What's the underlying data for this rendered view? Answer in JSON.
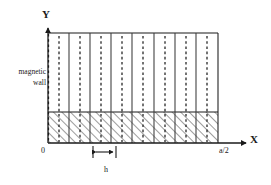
{
  "figure": {
    "axes": {
      "y_label": "Y",
      "x_label": "X",
      "origin_label": "0",
      "x_end_label": "a/2"
    },
    "annotations": {
      "magnetic_wall_line1": "magnetic",
      "magnetic_wall_line2": "wall",
      "period_label": "h"
    },
    "colors": {
      "stroke": "#1a1a1a",
      "hatch": "#555555",
      "dash": "#222222",
      "background": "#ffffff"
    },
    "geometry": {
      "x_origin": 48,
      "x_end": 218,
      "y_top": 33,
      "y_hatch_top": 112,
      "y_baseline": 143,
      "cell_count": 8,
      "dashed_line_count": 9,
      "h_marker_left": 93,
      "h_marker_right": 116,
      "h_marker_y": 152
    },
    "lines": {
      "solid_dividers_x": [
        69,
        90,
        111,
        132,
        154,
        175,
        196,
        218
      ],
      "dashed_centers_x": [
        48,
        69,
        90,
        111,
        132,
        154,
        175,
        196,
        218
      ]
    }
  }
}
